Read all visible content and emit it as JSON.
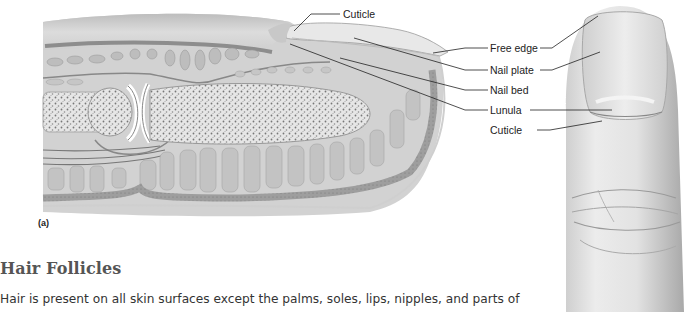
{
  "figure": {
    "panel_letter": "(a)",
    "labels": {
      "cuticle_top": "Cuticle",
      "free_edge": "Free edge",
      "nail_plate": "Nail plate",
      "nail_bed": "Nail bed",
      "lunula": "Lunula",
      "cuticle_bottom": "Cuticle"
    }
  },
  "section": {
    "heading": "Hair Follicles",
    "body": "Hair is present on all skin surfaces except the palms, soles, lips, nipples, and parts of"
  }
}
